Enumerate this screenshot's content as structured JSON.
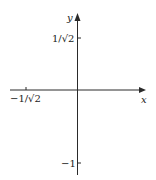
{
  "diagram": {
    "type": "coordinate-axes",
    "colors": {
      "axis": "#2a2a2a",
      "text": "#222222",
      "background": "#ffffff"
    },
    "axes": {
      "x_label": "x",
      "y_label": "y"
    },
    "ticks": {
      "y_top": {
        "label": "1/√2",
        "value": 0.7071
      },
      "y_bottom": {
        "label": "−1",
        "value": -1
      },
      "x_left": {
        "label": "−1/√2",
        "value": -0.7071
      }
    }
  }
}
